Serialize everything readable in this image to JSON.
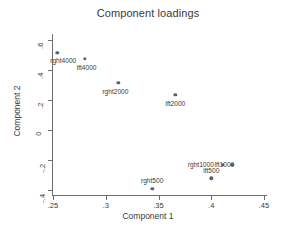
{
  "chart_data": {
    "type": "scatter",
    "title": "Component loadings",
    "xlabel": "Component 1",
    "ylabel": "Component 2",
    "xlim": [
      0.25,
      0.45
    ],
    "ylim": [
      -0.4,
      0.6
    ],
    "xticks": [
      ".25",
      ".3",
      ".35",
      ".4",
      ".45"
    ],
    "xtick_values": [
      0.25,
      0.3,
      0.35,
      0.4,
      0.45
    ],
    "yticks": [
      ".6",
      ".4",
      ".2",
      "0",
      "-.2",
      "-.4"
    ],
    "ytick_values": [
      0.6,
      0.4,
      0.2,
      0,
      -0.2,
      -0.4
    ],
    "grid": false,
    "legend": "none",
    "points": [
      {
        "label": "rght4000",
        "x": 0.254,
        "y": 0.513,
        "label_dx": 6,
        "label_dy": 4
      },
      {
        "label": "lft4000",
        "x": 0.28,
        "y": 0.473,
        "label_dx": 2,
        "label_dy": 5
      },
      {
        "label": "rght2000",
        "x": 0.312,
        "y": 0.316,
        "label_dx": -3,
        "label_dy": 5
      },
      {
        "label": "lft2000",
        "x": 0.366,
        "y": 0.234,
        "label_dx": 0,
        "label_dy": 5
      },
      {
        "label": "rght1000",
        "x": 0.411,
        "y": -0.233,
        "label_dx": -22,
        "label_dy": -4
      },
      {
        "label": "lft1000",
        "x": 0.42,
        "y": -0.233,
        "label_dx": -8,
        "label_dy": -4
      },
      {
        "label": "rght500",
        "x": 0.344,
        "y": -0.39,
        "label_dx": 0,
        "label_dy": -12
      },
      {
        "label": "lft500",
        "x": 0.4,
        "y": -0.322,
        "label_dx": 0,
        "label_dy": -11
      }
    ]
  }
}
